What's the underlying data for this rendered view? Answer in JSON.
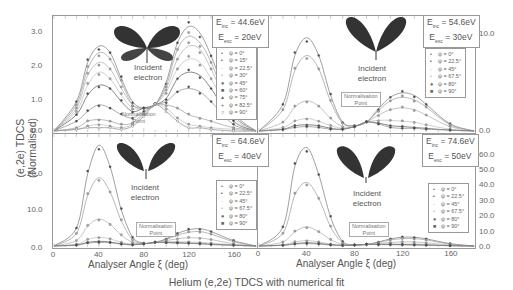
{
  "figure": {
    "caption": "Helium (e,2e) TDCS with numerical fit",
    "ylabel": "(e,2e) TDCS (Normalised)",
    "xlabel": "Analyser Angle ξ (deg)",
    "xticks": [
      "0",
      "40",
      "80",
      "120",
      "160"
    ],
    "incident_label_line1": "Incident",
    "incident_label_line2": "electron",
    "norm_label_line1": "Normalisation",
    "norm_label_line2": "Point"
  },
  "panels": [
    {
      "position": "top-left",
      "einc": "= 44.6eV",
      "eexc": "= 20eV",
      "yticks": [
        "3.0",
        "2.0",
        "1.0",
        "0.0"
      ],
      "legend": [
        "ψ = 0°",
        "ψ = 15°",
        "ψ = 22.5°",
        "ψ = 30°",
        "ψ = 45°",
        "ψ = 60°",
        "ψ = 75°",
        "ψ = 82.5°",
        "ψ = 90°"
      ]
    },
    {
      "position": "top-right",
      "einc": "= 54.6eV",
      "eexc": "= 30eV",
      "yticks": [
        "10.0",
        "0.0"
      ],
      "legend": [
        "ψ = 0°",
        "ψ = 22.5°",
        "ψ = 45°",
        "ψ = 67.5°",
        "ψ = 80°",
        "ψ = 90°"
      ]
    },
    {
      "position": "bottom-left",
      "einc": "= 64.6eV",
      "eexc": "= 40eV",
      "yticks": [
        "20.0",
        "10.0",
        "0.0"
      ],
      "legend": [
        "ψ = 0°",
        "ψ = 22.5°",
        "ψ = 45°",
        "ψ = 67.5°",
        "ψ = 80°",
        "ψ = 90°"
      ]
    },
    {
      "position": "bottom-right",
      "einc": "= 74.6eV",
      "eexc": "= 50eV",
      "yticks": [
        "60.0",
        "50.0",
        "40.0",
        "30.0",
        "20.0",
        "10.0",
        "0.0"
      ],
      "legend": [
        "ψ = 0°",
        "ψ = 22.5°",
        "ψ = 45°",
        "ψ = 67.5°",
        "ψ = 80°",
        "ψ = 90°"
      ]
    }
  ],
  "chart_data": [
    {
      "type": "line",
      "title": "E_inc = 44.6eV, E_exc = 20eV",
      "xlabel": "Analyser Angle ξ (deg)",
      "ylabel": "(e,2e) TDCS (Normalised)",
      "xlim": [
        0,
        180
      ],
      "ylim": [
        0,
        3.4
      ],
      "x": [
        0,
        20,
        30,
        40,
        50,
        60,
        70,
        80,
        90,
        100,
        110,
        120,
        130,
        140,
        160,
        180
      ],
      "series": [
        {
          "name": "ψ = 0°",
          "values": [
            0,
            0.9,
            2.1,
            2.6,
            2.4,
            1.6,
            0.9,
            0.7,
            0.8,
            1.5,
            2.7,
            3.2,
            3.0,
            2.3,
            0.6,
            0
          ]
        },
        {
          "name": "ψ = 15°",
          "values": [
            0,
            0.8,
            1.9,
            2.4,
            2.2,
            1.5,
            0.8,
            0.7,
            0.8,
            1.4,
            2.5,
            2.9,
            2.7,
            2.1,
            0.5,
            0
          ]
        },
        {
          "name": "ψ = 22.5°",
          "values": [
            0,
            0.7,
            1.7,
            2.1,
            1.9,
            1.3,
            0.8,
            0.7,
            0.8,
            1.3,
            2.2,
            2.6,
            2.5,
            1.9,
            0.5,
            0
          ]
        },
        {
          "name": "ψ = 30°",
          "values": [
            0,
            0.6,
            1.4,
            1.8,
            1.6,
            1.1,
            0.7,
            0.7,
            0.8,
            1.2,
            1.9,
            2.2,
            2.1,
            1.6,
            0.4,
            0
          ]
        },
        {
          "name": "ψ = 45°",
          "values": [
            0,
            0.5,
            1.1,
            1.4,
            1.3,
            0.9,
            0.6,
            0.7,
            0.8,
            1.0,
            1.6,
            1.8,
            1.7,
            1.3,
            0.3,
            0
          ]
        },
        {
          "name": "ψ = 60°",
          "values": [
            0,
            0.3,
            0.6,
            0.8,
            0.7,
            0.5,
            0.4,
            0.6,
            0.8,
            0.9,
            1.2,
            1.3,
            1.2,
            0.9,
            0.2,
            0
          ]
        },
        {
          "name": "ψ = 75°",
          "values": [
            0,
            0.1,
            0.3,
            0.35,
            0.3,
            0.2,
            0.25,
            0.55,
            0.8,
            0.8,
            0.7,
            0.5,
            0.4,
            0.3,
            0.1,
            0
          ]
        },
        {
          "name": "ψ = 82.5°",
          "values": [
            0,
            0.05,
            0.15,
            0.2,
            0.15,
            0.1,
            0.2,
            0.5,
            0.8,
            0.7,
            0.4,
            0.2,
            0.15,
            0.1,
            0.05,
            0
          ]
        },
        {
          "name": "ψ = 90°",
          "values": [
            0,
            0.05,
            0.1,
            0.1,
            0.1,
            0.05,
            0.15,
            0.45,
            0.8,
            0.6,
            0.3,
            0.1,
            0.1,
            0.05,
            0,
            0
          ]
        }
      ],
      "annotations": [
        "Incident electron",
        "Normalisation Point (ξ≈90°)"
      ]
    },
    {
      "type": "line",
      "title": "E_inc = 54.6eV, E_exc = 30eV",
      "xlabel": "Analyser Angle ξ (deg)",
      "ylabel": "(e,2e) TDCS (Normalised)",
      "xlim": [
        0,
        180
      ],
      "ylim": [
        0,
        12.5
      ],
      "x": [
        0,
        20,
        30,
        40,
        50,
        60,
        70,
        80,
        90,
        100,
        110,
        120,
        130,
        140,
        160,
        180
      ],
      "series": [
        {
          "name": "ψ = 0°",
          "values": [
            0,
            3.0,
            8.5,
            10.5,
            8.5,
            4.0,
            1.0,
            0.6,
            1.0,
            2.5,
            3.8,
            4.3,
            4.0,
            3.0,
            0.8,
            0
          ]
        },
        {
          "name": "ψ = 22.5°",
          "values": [
            0,
            2.4,
            6.8,
            8.5,
            7.0,
            3.3,
            0.9,
            0.6,
            1.0,
            2.3,
            3.4,
            3.8,
            3.5,
            2.7,
            0.7,
            0
          ]
        },
        {
          "name": "ψ = 45°",
          "values": [
            0,
            1.0,
            2.7,
            3.4,
            2.8,
            1.4,
            0.5,
            0.5,
            1.0,
            1.8,
            2.4,
            2.6,
            2.4,
            1.8,
            0.5,
            0
          ]
        },
        {
          "name": "ψ = 67.5°",
          "values": [
            0,
            0.4,
            1.1,
            1.4,
            1.1,
            0.6,
            0.3,
            0.5,
            1.0,
            1.2,
            1.2,
            1.1,
            1.0,
            0.7,
            0.2,
            0
          ]
        },
        {
          "name": "ψ = 80°",
          "values": [
            0,
            0.2,
            0.6,
            0.7,
            0.6,
            0.3,
            0.2,
            0.5,
            1.0,
            0.9,
            0.6,
            0.5,
            0.4,
            0.3,
            0.1,
            0
          ]
        },
        {
          "name": "ψ = 90°",
          "values": [
            0,
            0.15,
            0.4,
            0.5,
            0.4,
            0.2,
            0.2,
            0.5,
            1.0,
            0.8,
            0.4,
            0.3,
            0.3,
            0.2,
            0.1,
            0
          ]
        }
      ],
      "annotations": [
        "Incident electron",
        "Normalisation Point (ξ≈90°)"
      ]
    },
    {
      "type": "line",
      "title": "E_inc = 64.6eV, E_exc = 40eV",
      "xlabel": "Analyser Angle ξ (deg)",
      "ylabel": "(e,2e) TDCS (Normalised)",
      "xlim": [
        0,
        180
      ],
      "ylim": [
        0,
        30
      ],
      "x": [
        0,
        20,
        30,
        40,
        50,
        60,
        70,
        80,
        90,
        100,
        110,
        120,
        130,
        140,
        160,
        180
      ],
      "series": [
        {
          "name": "ψ = 0°",
          "values": [
            0,
            5.0,
            20.0,
            28.0,
            22.0,
            10.0,
            2.5,
            0.8,
            1.0,
            2.0,
            3.5,
            4.5,
            4.8,
            4.0,
            1.5,
            0
          ]
        },
        {
          "name": "ψ = 22.5°",
          "values": [
            0,
            3.5,
            14.0,
            19.0,
            15.0,
            7.0,
            1.8,
            0.7,
            1.0,
            1.8,
            3.0,
            3.8,
            4.0,
            3.3,
            1.2,
            0
          ]
        },
        {
          "name": "ψ = 45°",
          "values": [
            0,
            1.5,
            5.5,
            7.5,
            6.0,
            3.0,
            1.0,
            0.6,
            1.0,
            1.5,
            2.0,
            2.3,
            2.2,
            1.8,
            0.6,
            0
          ]
        },
        {
          "name": "ψ = 67.5°",
          "values": [
            0,
            0.5,
            1.8,
            2.4,
            2.0,
            1.0,
            0.5,
            0.6,
            1.0,
            1.2,
            1.2,
            1.1,
            1.0,
            0.8,
            0.3,
            0
          ]
        },
        {
          "name": "ψ = 80°",
          "values": [
            0,
            0.3,
            1.0,
            1.3,
            1.1,
            0.6,
            0.4,
            0.6,
            1.0,
            1.0,
            0.9,
            0.8,
            0.7,
            0.5,
            0.2,
            0
          ]
        },
        {
          "name": "ψ = 90°",
          "values": [
            0,
            0.2,
            0.8,
            1.0,
            0.9,
            0.5,
            0.3,
            0.6,
            1.0,
            0.9,
            0.8,
            0.7,
            0.6,
            0.4,
            0.2,
            0
          ]
        }
      ],
      "annotations": [
        "Incident electron",
        "Normalisation Point (ξ≈90°)"
      ]
    },
    {
      "type": "line",
      "title": "E_inc = 74.6eV, E_exc = 50eV",
      "xlabel": "Analyser Angle ξ (deg)",
      "ylabel": "(e,2e) TDCS (Normalised)",
      "xlim": [
        0,
        180
      ],
      "ylim": [
        0,
        68
      ],
      "x": [
        0,
        20,
        30,
        40,
        50,
        60,
        70,
        80,
        90,
        100,
        110,
        120,
        130,
        140,
        160,
        180
      ],
      "series": [
        {
          "name": "ψ = 0°",
          "values": [
            0,
            12.0,
            50.0,
            62.0,
            45.0,
            18.0,
            3.0,
            0.8,
            1.0,
            2.5,
            4.5,
            5.5,
            5.5,
            4.5,
            1.5,
            0
          ]
        },
        {
          "name": "ψ = 22.5°",
          "values": [
            0,
            8.0,
            32.0,
            40.0,
            30.0,
            12.0,
            2.0,
            0.7,
            1.0,
            2.2,
            3.8,
            4.6,
            4.6,
            3.8,
            1.2,
            0
          ]
        },
        {
          "name": "ψ = 45°",
          "values": [
            0,
            2.5,
            9.0,
            12.0,
            9.0,
            4.0,
            1.0,
            0.6,
            1.0,
            1.6,
            2.2,
            2.6,
            2.5,
            2.0,
            0.6,
            0
          ]
        },
        {
          "name": "ψ = 67.5°",
          "values": [
            0,
            0.8,
            2.6,
            3.4,
            2.6,
            1.2,
            0.5,
            0.6,
            1.0,
            1.2,
            1.3,
            1.3,
            1.2,
            1.0,
            0.3,
            0
          ]
        },
        {
          "name": "ψ = 80°",
          "values": [
            0,
            0.5,
            1.5,
            2.0,
            1.6,
            0.8,
            0.4,
            0.6,
            1.0,
            1.0,
            1.0,
            0.9,
            0.8,
            0.6,
            0.2,
            0
          ]
        },
        {
          "name": "ψ = 90°",
          "values": [
            0,
            0.4,
            1.2,
            1.5,
            1.2,
            0.6,
            0.3,
            0.6,
            1.0,
            0.9,
            0.8,
            0.7,
            0.6,
            0.5,
            0.2,
            0
          ]
        }
      ],
      "annotations": [
        "Incident electron",
        "Normalisation Point (ξ≈90°)"
      ]
    }
  ]
}
